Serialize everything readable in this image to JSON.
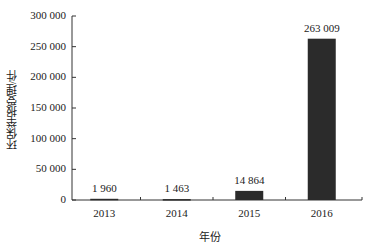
{
  "chart_data": {
    "type": "bar",
    "title": "",
    "xlabel": "年份",
    "ylabel": "环保举报受理/件",
    "categories": [
      "2013",
      "2014",
      "2015",
      "2016"
    ],
    "values": [
      1960,
      1463,
      14864,
      263009
    ],
    "value_labels": [
      "1 960",
      "1 463",
      "14 864",
      "263 009"
    ],
    "ylim": [
      0,
      300000
    ],
    "yticks": [
      0,
      50000,
      100000,
      150000,
      200000,
      250000,
      300000
    ],
    "ytick_labels": [
      "0",
      "50 000",
      "100 000",
      "150 000",
      "200 000",
      "250 000",
      "300 000"
    ],
    "grid": false,
    "legend": null,
    "bar_color": "#2b2b2b"
  }
}
